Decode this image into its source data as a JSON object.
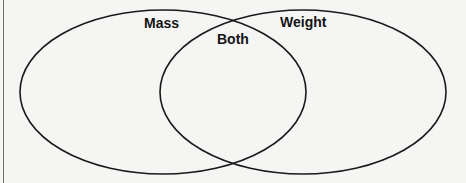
{
  "diagram": {
    "type": "venn",
    "sets": [
      {
        "id": "left",
        "label": "Mass"
      },
      {
        "id": "right",
        "label": "Weight"
      }
    ],
    "intersection_label": "Both"
  },
  "style": {
    "stroke_color": "#1a1a1a",
    "background": "#f5f5f4"
  }
}
